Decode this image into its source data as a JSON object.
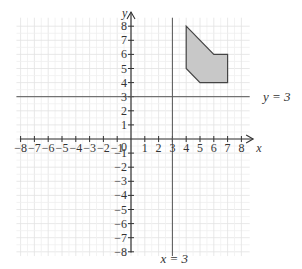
{
  "chart_data": {
    "type": "diagram",
    "title": "",
    "xlabel": "x",
    "ylabel": "y",
    "xlim": [
      -8,
      8
    ],
    "ylim": [
      -8,
      8
    ],
    "x_ticks": [
      "-8",
      "-7",
      "-6",
      "-5",
      "-4",
      "-3",
      "-2",
      "-1",
      "0",
      "1",
      "2",
      "3",
      "4",
      "5",
      "6",
      "7",
      "8"
    ],
    "y_ticks": [
      "8",
      "7",
      "6",
      "5",
      "4",
      "3",
      "2",
      "1",
      "-1",
      "-2",
      "-3",
      "-4",
      "-5",
      "-6",
      "-7",
      "-8"
    ],
    "grid": true,
    "lines": [
      {
        "label": "y = 3",
        "orientation": "horizontal",
        "value": 3
      },
      {
        "label": "x = 3",
        "orientation": "vertical",
        "value": 3
      }
    ],
    "polygon": {
      "vertices": [
        [
          4,
          8
        ],
        [
          6,
          6
        ],
        [
          7,
          6
        ],
        [
          7,
          4
        ],
        [
          5,
          4
        ],
        [
          4,
          5
        ]
      ],
      "fill": "#c8c8c8",
      "stroke": "#444444"
    }
  },
  "labels": {
    "x_axis": "x",
    "y_axis": "y",
    "origin": "0",
    "line_y3": "y = 3",
    "line_x3": "x = 3"
  }
}
